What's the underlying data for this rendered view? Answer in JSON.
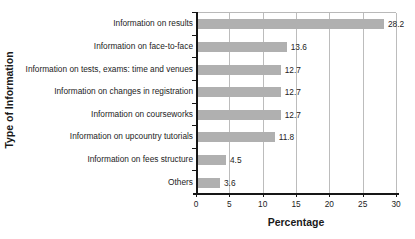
{
  "chart_data": {
    "type": "bar",
    "orientation": "horizontal",
    "title": "",
    "xlabel": "Percentage",
    "ylabel": "Type of Information",
    "xlim": [
      0,
      30
    ],
    "xticks": [
      0,
      5,
      10,
      15,
      20,
      25,
      30
    ],
    "grid": "vertical",
    "legend": "none",
    "bar_color": "#b0b0b0",
    "categories": [
      "Information on results",
      "Information on face-to-face",
      "Information on tests, exams: time and venues",
      "Information on changes in registration",
      "Information on courseworks",
      "Information on upcountry tutorials",
      "Information on fees structure",
      "Others"
    ],
    "values": [
      28.2,
      13.6,
      12.7,
      12.7,
      12.7,
      11.8,
      4.5,
      3.6
    ],
    "value_labels": [
      "28.2",
      "13.6",
      "12.7",
      "12.7",
      "12.7",
      "11.8",
      "4.5",
      "3.6"
    ],
    "xtick_labels": [
      "0",
      "5",
      "10",
      "15",
      "20",
      "25",
      "30"
    ]
  }
}
